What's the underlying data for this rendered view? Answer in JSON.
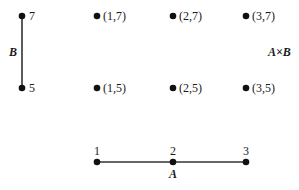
{
  "diagram": {
    "set_b": {
      "label": "B",
      "elements": [
        "7",
        "5"
      ]
    },
    "set_a": {
      "label": "A",
      "elements": [
        "1",
        "2",
        "3"
      ]
    },
    "product": {
      "label": "A×B",
      "points": [
        "(1,7)",
        "(2,7)",
        "(3,7)",
        "(1,5)",
        "(2,5)",
        "(3,5)"
      ]
    }
  }
}
